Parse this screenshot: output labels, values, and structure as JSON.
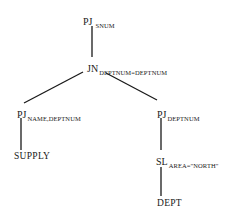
{
  "diagram": {
    "type": "query-tree",
    "nodes": [
      {
        "id": "pj_snum",
        "op": "PJ",
        "sub": "SNUM"
      },
      {
        "id": "jn",
        "op": "JN",
        "sub": "DEPTNUM=DEPTNUM"
      },
      {
        "id": "pj_name_deptnum",
        "op": "PJ",
        "sub": "NAME,DEPTNUM"
      },
      {
        "id": "supply",
        "label": "SUPPLY"
      },
      {
        "id": "pj_deptnum",
        "op": "PJ",
        "sub": "DEPTNUM"
      },
      {
        "id": "sl_area",
        "op": "SL",
        "sub": "AREA=\"NORTH\""
      },
      {
        "id": "dept",
        "label": "DEPT"
      }
    ],
    "edges": [
      [
        "pj_snum",
        "jn"
      ],
      [
        "jn",
        "pj_name_deptnum"
      ],
      [
        "jn",
        "pj_deptnum"
      ],
      [
        "pj_name_deptnum",
        "supply"
      ],
      [
        "pj_deptnum",
        "sl_area"
      ],
      [
        "sl_area",
        "dept"
      ]
    ],
    "line_color": "#1a1a1a"
  }
}
